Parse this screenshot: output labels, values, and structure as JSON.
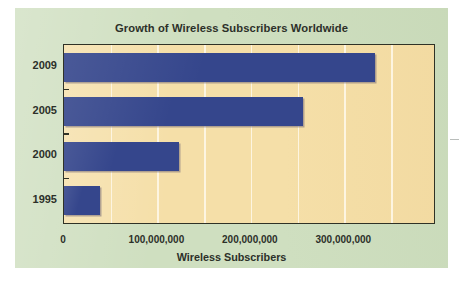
{
  "chart_data": {
    "type": "bar",
    "orientation": "horizontal",
    "title": "Growth of Wireless Subscribers Worldwide",
    "xlabel": "Wireless Subscribers",
    "ylabel": "",
    "categories": [
      "2009",
      "2005",
      "2000",
      "1995"
    ],
    "values": [
      333000000,
      256000000,
      123000000,
      39000000
    ],
    "series": [
      {
        "name": "Wireless Subscribers",
        "values": [
          333000000,
          256000000,
          123000000,
          39000000
        ],
        "color": "#35468c"
      }
    ],
    "xlim": [
      0,
      396000000
    ],
    "ylim": null,
    "xticks": [
      0,
      100000000,
      200000000,
      300000000
    ],
    "xtick_labels": [
      "0",
      "100,000,000",
      "200,000,000",
      "300,000,000"
    ],
    "ytick_labels": [
      "2009",
      "2005",
      "2000",
      "1995"
    ],
    "gridlines": {
      "vertical": true,
      "horizontal": false,
      "count": 7,
      "color": "#fdf6e4"
    },
    "legend": null,
    "annotations": []
  },
  "figure": {
    "panel_color": "#cfdfc0",
    "plot_background": "#f5dfa8",
    "axis_color": "#2f3226",
    "bar_color": "#35468c",
    "text_color": "#2c3029"
  }
}
